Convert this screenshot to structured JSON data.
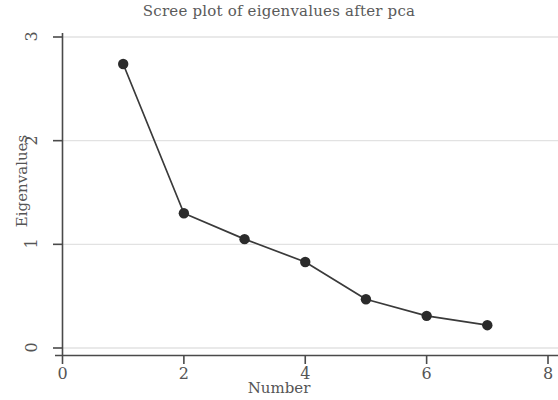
{
  "chart_data": {
    "type": "line",
    "title": "Scree plot of eigenvalues after pca",
    "xlabel": "Number",
    "ylabel": "Eigenvalues",
    "x": [
      1,
      2,
      3,
      4,
      5,
      6,
      7
    ],
    "values": [
      2.74,
      1.3,
      1.05,
      0.83,
      0.47,
      0.31,
      0.22
    ],
    "series": [
      {
        "name": "Eigenvalues",
        "values": [
          2.74,
          1.3,
          1.05,
          0.83,
          0.47,
          0.31,
          0.22
        ]
      }
    ],
    "xlim": [
      0,
      8
    ],
    "ylim": [
      0,
      3
    ],
    "xticks": [
      0,
      2,
      4,
      6,
      8
    ],
    "yticks": [
      0,
      1,
      2,
      3
    ],
    "xtick_labels": [
      "0",
      "2",
      "4",
      "6",
      "8"
    ],
    "ytick_labels": [
      "0",
      "1",
      "2",
      "3"
    ],
    "grid": "horizontal",
    "legend": "none",
    "marker": "filled-circle",
    "line_color": "#3a3a3a",
    "marker_color": "#2b2b2b",
    "grid_color": "#e2e2e2",
    "axis_color": "#4a4a4a",
    "background": "#ffffff"
  }
}
